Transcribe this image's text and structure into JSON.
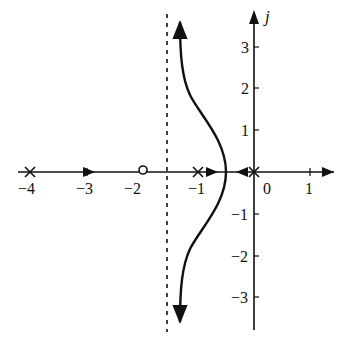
{
  "diagram": {
    "type": "root-locus",
    "imag_axis_label": "j",
    "real_axis_ticks": [
      {
        "value": -4,
        "label": "−4",
        "x": 30
      },
      {
        "value": -3,
        "label": "−3",
        "x": 87
      },
      {
        "value": -2,
        "label": "−2",
        "x": 141
      },
      {
        "value": -1,
        "label": "−1",
        "x": 198
      },
      {
        "value": 0,
        "label": "0",
        "x": 254
      },
      {
        "value": 1,
        "label": "1",
        "x": 310
      }
    ],
    "imag_axis_ticks": [
      {
        "value": 3,
        "label": "3",
        "y": 47
      },
      {
        "value": 2,
        "label": "2",
        "y": 88
      },
      {
        "value": 1,
        "label": "1",
        "y": 130
      },
      {
        "value": -1,
        "label": "−1",
        "y": 214
      },
      {
        "value": -2,
        "label": "−2",
        "y": 256
      },
      {
        "value": -3,
        "label": "−3",
        "y": 297
      }
    ],
    "poles": [
      -4,
      -1,
      0
    ],
    "zeros": [
      -2
    ],
    "asymptote_real": -1.5,
    "breakaway_point": -0.5,
    "colors": {
      "ink": "#111111",
      "background": "#ffffff"
    }
  }
}
